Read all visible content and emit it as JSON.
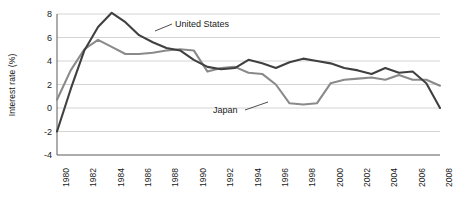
{
  "chart_data": {
    "type": "line",
    "title": "",
    "xlabel": "",
    "ylabel": "Interest rate (%)",
    "ylim": [
      -4,
      8
    ],
    "xlim": [
      1980,
      2008
    ],
    "yticks": [
      8,
      6,
      4,
      2,
      0,
      -2,
      -4
    ],
    "ytick_labels": [
      "8",
      "6",
      "4",
      "2",
      "0",
      "-2",
      "-4"
    ],
    "xticks": [
      1980,
      1982,
      1984,
      1986,
      1988,
      1990,
      1992,
      1994,
      1996,
      1998,
      2000,
      2002,
      2004,
      2006,
      2008
    ],
    "xtick_labels": [
      "1980",
      "1982",
      "1984",
      "1986",
      "1988",
      "1990",
      "1992",
      "1994",
      "1996",
      "1998",
      "2000",
      "2002",
      "2004",
      "2006",
      "2008"
    ],
    "grid": true,
    "grid_axis": "y",
    "legend": "inline-annotations",
    "x": [
      1980,
      1981,
      1982,
      1983,
      1984,
      1985,
      1986,
      1987,
      1988,
      1989,
      1990,
      1991,
      1992,
      1993,
      1994,
      1995,
      1996,
      1997,
      1998,
      1999,
      2000,
      2001,
      2002,
      2003,
      2004,
      2005,
      2006,
      2007,
      2008
    ],
    "series": [
      {
        "name": "United States",
        "color": "#404040",
        "values": [
          -2.0,
          1.6,
          4.9,
          6.9,
          8.1,
          7.3,
          6.2,
          5.6,
          5.1,
          4.9,
          4.1,
          3.5,
          3.3,
          3.4,
          4.1,
          3.8,
          3.4,
          3.9,
          4.2,
          4.0,
          3.8,
          3.4,
          3.2,
          2.9,
          3.4,
          3.0,
          3.1,
          2.1,
          0.0
        ]
      },
      {
        "name": "Japan",
        "color": "#8a8a8a",
        "values": [
          0.7,
          3.2,
          5.0,
          5.8,
          5.2,
          4.6,
          4.6,
          4.7,
          4.9,
          5.0,
          4.9,
          3.1,
          3.4,
          3.5,
          3.0,
          2.9,
          2.0,
          0.4,
          0.3,
          0.4,
          2.1,
          2.4,
          2.5,
          2.6,
          2.4,
          2.8,
          2.4,
          2.4,
          1.9
        ]
      }
    ],
    "annotations": [
      {
        "label": "United States",
        "series": "United States"
      },
      {
        "label": "Japan",
        "series": "Japan"
      }
    ]
  }
}
